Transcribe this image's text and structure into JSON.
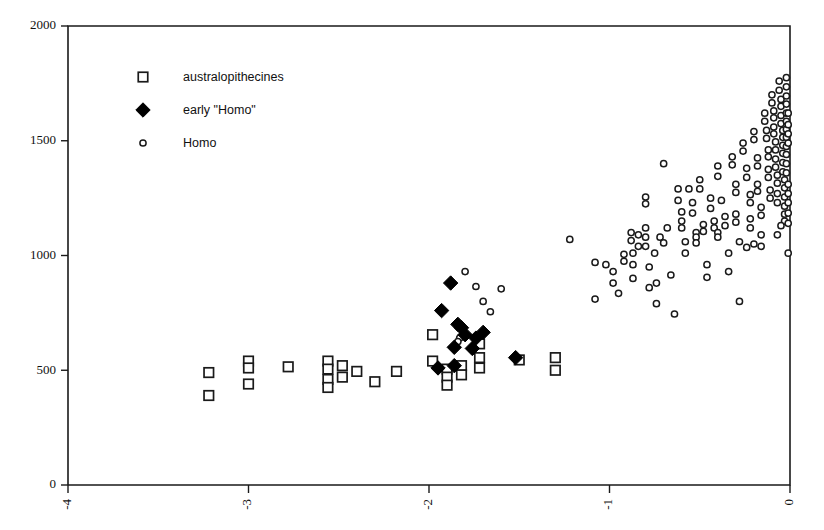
{
  "chart_data": {
    "type": "scatter",
    "title": "",
    "subtitle": "",
    "xlabel": "",
    "ylabel": "",
    "xlim": [
      -4,
      0
    ],
    "ylim": [
      0,
      2000
    ],
    "xticks": [
      -4,
      -3,
      -2,
      -1,
      0
    ],
    "xtick_labels": [
      "-4",
      "-3",
      "-2",
      "-1",
      "0"
    ],
    "yticks": [
      0,
      500,
      1000,
      1500,
      2000
    ],
    "ytick_labels": [
      "0",
      "500",
      "1000",
      "1500",
      "2000"
    ],
    "grid": false,
    "xtick_label_rotation": -90,
    "legend_position": "upper-left-inside",
    "legend": [
      {
        "label": "australopithecines",
        "marker": "open-square",
        "color": "#1a1a1a"
      },
      {
        "label": "early \"Homo\"",
        "marker": "filled-diamond",
        "color": "#000000"
      },
      {
        "label": "Homo",
        "marker": "open-circle",
        "color": "#1a1a1a"
      }
    ],
    "series": [
      {
        "name": "australopithecines",
        "marker": "open-square",
        "points": [
          [
            -3.22,
            490
          ],
          [
            -3.22,
            390
          ],
          [
            -3.0,
            540
          ],
          [
            -3.0,
            510
          ],
          [
            -3.0,
            440
          ],
          [
            -2.78,
            515
          ],
          [
            -2.56,
            540
          ],
          [
            -2.56,
            505
          ],
          [
            -2.56,
            460
          ],
          [
            -2.56,
            425
          ],
          [
            -2.48,
            520
          ],
          [
            -2.48,
            470
          ],
          [
            -2.4,
            495
          ],
          [
            -2.3,
            450
          ],
          [
            -2.18,
            495
          ],
          [
            -1.98,
            655
          ],
          [
            -1.98,
            540
          ],
          [
            -1.9,
            505
          ],
          [
            -1.9,
            470
          ],
          [
            -1.9,
            435
          ],
          [
            -1.82,
            520
          ],
          [
            -1.82,
            480
          ],
          [
            -1.72,
            615
          ],
          [
            -1.72,
            555
          ],
          [
            -1.72,
            510
          ],
          [
            -1.5,
            545
          ],
          [
            -1.3,
            555
          ],
          [
            -1.3,
            500
          ]
        ]
      },
      {
        "name": "early \"Homo\"",
        "marker": "filled-diamond",
        "points": [
          [
            -1.88,
            880
          ],
          [
            -1.93,
            760
          ],
          [
            -1.84,
            700
          ],
          [
            -1.82,
            685
          ],
          [
            -1.8,
            655
          ],
          [
            -1.86,
            600
          ],
          [
            -1.86,
            520
          ],
          [
            -1.76,
            595
          ],
          [
            -1.74,
            640
          ],
          [
            -1.7,
            665
          ],
          [
            -1.95,
            510
          ],
          [
            -1.52,
            555
          ]
        ]
      },
      {
        "name": "Homo",
        "marker": "open-circle",
        "points": [
          [
            -1.8,
            930
          ],
          [
            -1.74,
            865
          ],
          [
            -1.7,
            800
          ],
          [
            -1.66,
            755
          ],
          [
            -1.83,
            640
          ],
          [
            -1.84,
            625
          ],
          [
            -1.6,
            855
          ],
          [
            -1.22,
            1070
          ],
          [
            -1.08,
            970
          ],
          [
            -1.08,
            810
          ],
          [
            -1.02,
            960
          ],
          [
            -0.98,
            930
          ],
          [
            -0.98,
            880
          ],
          [
            -0.95,
            835
          ],
          [
            -0.92,
            1005
          ],
          [
            -0.92,
            975
          ],
          [
            -0.88,
            1100
          ],
          [
            -0.88,
            1065
          ],
          [
            -0.87,
            1010
          ],
          [
            -0.87,
            960
          ],
          [
            -0.87,
            900
          ],
          [
            -0.84,
            1090
          ],
          [
            -0.84,
            1040
          ],
          [
            -0.8,
            1255
          ],
          [
            -0.8,
            1225
          ],
          [
            -0.8,
            1120
          ],
          [
            -0.8,
            1080
          ],
          [
            -0.8,
            1040
          ],
          [
            -0.78,
            950
          ],
          [
            -0.78,
            860
          ],
          [
            -0.75,
            1010
          ],
          [
            -0.74,
            880
          ],
          [
            -0.74,
            790
          ],
          [
            -0.72,
            1080
          ],
          [
            -0.7,
            1400
          ],
          [
            -0.7,
            1055
          ],
          [
            -0.68,
            1120
          ],
          [
            -0.66,
            915
          ],
          [
            -0.64,
            745
          ],
          [
            -0.62,
            1290
          ],
          [
            -0.62,
            1240
          ],
          [
            -0.6,
            1190
          ],
          [
            -0.6,
            1150
          ],
          [
            -0.6,
            1120
          ],
          [
            -0.58,
            1060
          ],
          [
            -0.58,
            1010
          ],
          [
            -0.56,
            1290
          ],
          [
            -0.54,
            1230
          ],
          [
            -0.54,
            1185
          ],
          [
            -0.52,
            1100
          ],
          [
            -0.52,
            1080
          ],
          [
            -0.52,
            1055
          ],
          [
            -0.5,
            1330
          ],
          [
            -0.5,
            1290
          ],
          [
            -0.48,
            1135
          ],
          [
            -0.48,
            1105
          ],
          [
            -0.46,
            960
          ],
          [
            -0.46,
            905
          ],
          [
            -0.44,
            1250
          ],
          [
            -0.44,
            1205
          ],
          [
            -0.42,
            1150
          ],
          [
            -0.42,
            1120
          ],
          [
            -0.4,
            1390
          ],
          [
            -0.4,
            1345
          ],
          [
            -0.4,
            1100
          ],
          [
            -0.4,
            1080
          ],
          [
            -0.38,
            1240
          ],
          [
            -0.36,
            1170
          ],
          [
            -0.36,
            1130
          ],
          [
            -0.34,
            1010
          ],
          [
            -0.34,
            930
          ],
          [
            -0.32,
            1430
          ],
          [
            -0.32,
            1395
          ],
          [
            -0.3,
            1310
          ],
          [
            -0.3,
            1275
          ],
          [
            -0.3,
            1180
          ],
          [
            -0.3,
            1145
          ],
          [
            -0.28,
            1060
          ],
          [
            -0.28,
            800
          ],
          [
            -0.26,
            1490
          ],
          [
            -0.26,
            1455
          ],
          [
            -0.24,
            1380
          ],
          [
            -0.24,
            1340
          ],
          [
            -0.22,
            1265
          ],
          [
            -0.22,
            1230
          ],
          [
            -0.22,
            1160
          ],
          [
            -0.22,
            1120
          ],
          [
            -0.2,
            1540
          ],
          [
            -0.2,
            1505
          ],
          [
            -0.18,
            1425
          ],
          [
            -0.18,
            1390
          ],
          [
            -0.18,
            1310
          ],
          [
            -0.18,
            1280
          ],
          [
            -0.16,
            1210
          ],
          [
            -0.16,
            1175
          ],
          [
            -0.16,
            1090
          ],
          [
            -0.16,
            1040
          ],
          [
            -0.14,
            1620
          ],
          [
            -0.14,
            1585
          ],
          [
            -0.13,
            1545
          ],
          [
            -0.13,
            1510
          ],
          [
            -0.12,
            1460
          ],
          [
            -0.12,
            1430
          ],
          [
            -0.12,
            1375
          ],
          [
            -0.12,
            1340
          ],
          [
            -0.11,
            1285
          ],
          [
            -0.11,
            1250
          ],
          [
            -0.1,
            1700
          ],
          [
            -0.1,
            1665
          ],
          [
            -0.09,
            1630
          ],
          [
            -0.09,
            1600
          ],
          [
            -0.09,
            1560
          ],
          [
            -0.09,
            1530
          ],
          [
            -0.08,
            1495
          ],
          [
            -0.08,
            1460
          ],
          [
            -0.08,
            1420
          ],
          [
            -0.08,
            1385
          ],
          [
            -0.07,
            1350
          ],
          [
            -0.07,
            1315
          ],
          [
            -0.07,
            1270
          ],
          [
            -0.07,
            1230
          ],
          [
            -0.06,
            1760
          ],
          [
            -0.06,
            1720
          ],
          [
            -0.05,
            1680
          ],
          [
            -0.05,
            1650
          ],
          [
            -0.05,
            1610
          ],
          [
            -0.05,
            1575
          ],
          [
            -0.04,
            1545
          ],
          [
            -0.04,
            1515
          ],
          [
            -0.04,
            1480
          ],
          [
            -0.04,
            1445
          ],
          [
            -0.04,
            1405
          ],
          [
            -0.04,
            1365
          ],
          [
            -0.03,
            1330
          ],
          [
            -0.03,
            1295
          ],
          [
            -0.03,
            1255
          ],
          [
            -0.03,
            1215
          ],
          [
            -0.03,
            1180
          ],
          [
            -0.03,
            1150
          ],
          [
            -0.02,
            1775
          ],
          [
            -0.02,
            1735
          ],
          [
            -0.02,
            1695
          ],
          [
            -0.02,
            1660
          ],
          [
            -0.02,
            1620
          ],
          [
            -0.02,
            1585
          ],
          [
            -0.02,
            1550
          ],
          [
            -0.02,
            1515
          ],
          [
            -0.02,
            1475
          ],
          [
            -0.02,
            1440
          ],
          [
            -0.02,
            1400
          ],
          [
            -0.02,
            1360
          ],
          [
            -0.01,
            1620
          ],
          [
            -0.01,
            1570
          ],
          [
            -0.01,
            1530
          ],
          [
            -0.01,
            1490
          ],
          [
            -0.01,
            1310
          ],
          [
            -0.01,
            1270
          ],
          [
            -0.01,
            1230
          ],
          [
            -0.01,
            1185
          ],
          [
            -0.01,
            1140
          ],
          [
            -0.01,
            1010
          ],
          [
            -0.05,
            1130
          ],
          [
            -0.07,
            1090
          ],
          [
            -0.2,
            1050
          ],
          [
            -0.24,
            1035
          ]
        ]
      }
    ]
  }
}
